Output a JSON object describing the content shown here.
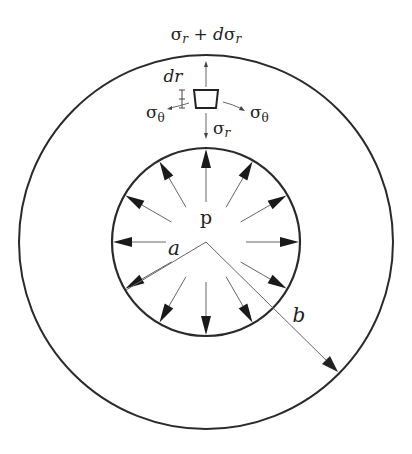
{
  "figure": {
    "labels": {
      "outer_stress": "σ",
      "outer_stress_sub": "r",
      "outer_stress_plus": " + ",
      "outer_stress_d": "d",
      "outer_stress_sigma": "σ",
      "outer_stress_sub2": "r",
      "dr_label": "dr",
      "hoop_left": "σ",
      "hoop_left_sub": "θ",
      "hoop_right": "σ",
      "hoop_right_sub": "θ",
      "inner_stress": "σ",
      "inner_stress_sub": "r",
      "pressure": "p",
      "inner_radius": "a",
      "outer_radius": "b"
    },
    "geometry": {
      "center": [
        206,
        242
      ],
      "outer_radius_px": 187,
      "inner_radius_px": 94,
      "pressure_arrow_count": 12
    },
    "colors": {
      "stroke": "#2a2a2a",
      "thin_line": "#555555",
      "background": "#ffffff"
    }
  }
}
